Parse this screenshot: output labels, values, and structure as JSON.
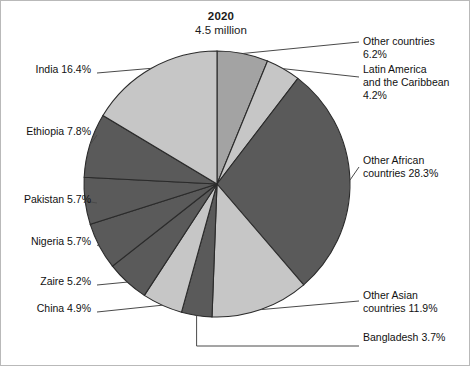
{
  "chart_data": {
    "type": "pie",
    "title": "2020",
    "subtitle": "4.5 million",
    "total_label": "4.5 million",
    "units": "percent",
    "legend": "callout-labels",
    "grid": false,
    "start_angle_deg": 0,
    "direction": "clockwise",
    "categories": [
      "Other countries",
      "Latin America and the Caribbean",
      "Other African countries",
      "Other Asian countries",
      "Bangladesh",
      "China",
      "Zaire",
      "Nigeria",
      "Pakistan",
      "Ethiopia",
      "India"
    ],
    "values": [
      6.2,
      4.2,
      28.3,
      11.9,
      3.7,
      4.9,
      5.2,
      5.7,
      5.7,
      7.8,
      16.4
    ],
    "slices": [
      {
        "name": "Other countries",
        "value": 6.2,
        "label": "Other countries\n6.2%",
        "color": "#a3a3a3",
        "side": "right"
      },
      {
        "name": "Latin America and the Caribbean",
        "value": 4.2,
        "label": "Latin America\nand the Caribbean\n4.2%",
        "color": "#c6c6c6",
        "side": "right"
      },
      {
        "name": "Other African countries",
        "value": 28.3,
        "label": "Other African\ncountries 28.3%",
        "color": "#5a5a5a",
        "side": "right"
      },
      {
        "name": "Other Asian countries",
        "value": 11.9,
        "label": "Other Asian\ncountries 11.9%",
        "color": "#c6c6c6",
        "side": "right"
      },
      {
        "name": "Bangladesh",
        "value": 3.7,
        "label": "Bangladesh 3.7%",
        "color": "#5a5a5a",
        "side": "bottom"
      },
      {
        "name": "China",
        "value": 4.9,
        "label": "China 4.9%",
        "color": "#c6c6c6",
        "side": "left"
      },
      {
        "name": "Zaire",
        "value": 5.2,
        "label": "Zaire 5.2%",
        "color": "#5a5a5a",
        "side": "left"
      },
      {
        "name": "Nigeria",
        "value": 5.7,
        "label": "Nigeria 5.7%",
        "color": "#5a5a5a",
        "side": "left"
      },
      {
        "name": "Pakistan",
        "value": 5.7,
        "label": "Pakistan 5.7%",
        "color": "#5a5a5a",
        "side": "left"
      },
      {
        "name": "Ethiopia",
        "value": 7.8,
        "label": "Ethiopia 7.8%",
        "color": "#5a5a5a",
        "side": "left"
      },
      {
        "name": "India",
        "value": 16.4,
        "label": "India 16.4%",
        "color": "#c6c6c6",
        "side": "left"
      }
    ],
    "colors": {
      "dark_gray": "#5a5a5a",
      "medium_gray": "#a3a3a3",
      "light_gray": "#c6c6c6",
      "outline": "#2b2b2b",
      "leader_line": "#4a4a4a",
      "background": "#ffffff"
    },
    "geometry": {
      "center_x": 216,
      "center_y": 183,
      "radius": 133
    }
  },
  "callouts": {
    "other_countries": {
      "text": "Other countries\n6.2%",
      "x": 362,
      "y": 41
    },
    "latin_america": {
      "text": "Latin America\nand the Caribbean\n4.2%",
      "x": 362,
      "y": 69
    },
    "other_african": {
      "text": "Other African\ncountries 28.3%",
      "x": 362,
      "y": 160
    },
    "other_asian": {
      "text": "Other Asian\ncountries 11.9%",
      "x": 362,
      "y": 295
    },
    "bangladesh": {
      "text": "Bangladesh 3.7%",
      "x": 362,
      "y": 337
    },
    "india": {
      "text": "India 16.4%",
      "x": 8,
      "y": 69
    },
    "ethiopia": {
      "text": "Ethiopia 7.8%",
      "x": 8,
      "y": 131
    },
    "pakistan": {
      "text": "Pakistan 5.7%",
      "x": 8,
      "y": 199
    },
    "nigeria": {
      "text": "Nigeria 5.7%",
      "x": 8,
      "y": 241
    },
    "zaire": {
      "text": "Zaire 5.2%",
      "x": 8,
      "y": 281
    },
    "china": {
      "text": "China 4.9%",
      "x": 8,
      "y": 308
    }
  }
}
